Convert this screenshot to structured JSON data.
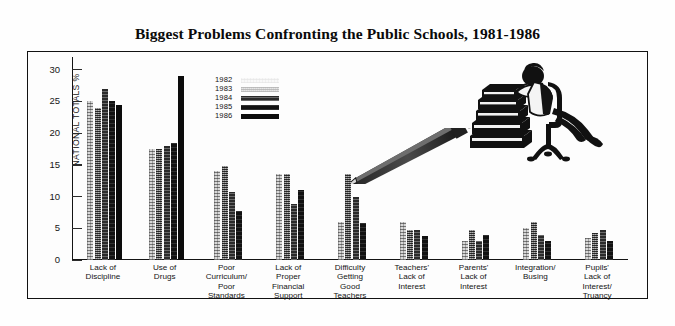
{
  "chart_data": {
    "type": "bar",
    "title": "Biggest Problems Confronting the Public Schools, 1981-1986",
    "xlabel": "",
    "ylabel": "NATIONAL TOTALS %",
    "ylim": [
      0,
      32
    ],
    "yticks": [
      0,
      5,
      10,
      15,
      20,
      25,
      30
    ],
    "grid": false,
    "legend_position": "upper-left-inside",
    "categories": [
      "Lack of Discipline",
      "Use of Drugs",
      "Poor Curriculum/ Poor Standards",
      "Lack of Proper Financial Support",
      "Difficulty Getting Good Teachers",
      "Teachers' Lack of Interest",
      "Parents' Lack of Interest",
      "Integration/ Busing",
      "Pupils' Lack of Interest/ Truancy"
    ],
    "series": [
      {
        "name": "1982",
        "values": [
          25.0,
          17.5,
          14.0,
          13.5,
          6.0,
          6.0,
          3.0,
          5.0,
          3.5
        ]
      },
      {
        "name": "1983",
        "values": [
          24.0,
          17.5,
          14.8,
          13.5,
          13.5,
          4.8,
          4.8,
          6.0,
          4.3
        ]
      },
      {
        "name": "1984",
        "values": [
          27.0,
          18.0,
          10.8,
          8.8,
          10.0,
          4.8,
          3.0,
          4.0,
          4.8
        ]
      },
      {
        "name": "1985",
        "values": [
          25.0,
          18.5,
          7.8,
          11.0,
          5.8,
          3.8,
          4.0,
          3.0,
          3.0
        ]
      },
      {
        "name": "1986",
        "values": [
          24.5,
          29.0,
          null,
          null,
          null,
          null,
          null,
          null,
          null
        ]
      }
    ]
  },
  "title": "Biggest Problems Confronting the Public Schools, 1981-1986",
  "axis": {
    "y_title": "NATIONAL TOTALS %",
    "y_ticks": [
      "30",
      "25",
      "20",
      "15",
      "10",
      "5",
      "0"
    ]
  },
  "legend": {
    "items": [
      {
        "label": "1982",
        "pattern": "p1982"
      },
      {
        "label": "1983",
        "pattern": "p1983"
      },
      {
        "label": "1984",
        "pattern": "p1984"
      },
      {
        "label": "1985",
        "pattern": "p1985"
      },
      {
        "label": "1986",
        "pattern": "p1986"
      }
    ]
  },
  "categories": [
    {
      "lines": [
        "Lack of",
        "Discipline"
      ]
    },
    {
      "lines": [
        "Use of",
        "Drugs"
      ]
    },
    {
      "lines": [
        "Poor",
        "Curriculum/",
        "Poor",
        "Standards"
      ]
    },
    {
      "lines": [
        "Lack of",
        "Proper",
        "Financial",
        "Support"
      ]
    },
    {
      "lines": [
        "Difficulty",
        "Getting",
        "Good",
        "Teachers"
      ]
    },
    {
      "lines": [
        "Teachers'",
        "Lack of",
        "Interest"
      ]
    },
    {
      "lines": [
        "Parents'",
        "Lack of",
        "Interest"
      ]
    },
    {
      "lines": [
        "Integration/",
        "Busing"
      ]
    },
    {
      "lines": [
        "Pupils'",
        "Lack of",
        "Interest/",
        "Truancy"
      ]
    }
  ],
  "illustrations": [
    {
      "name": "student-slumped-on-books",
      "description": "student resting head on tall stack of books beside an office chair"
    },
    {
      "name": "pencil",
      "description": "large pencil pointing up-right"
    }
  ]
}
